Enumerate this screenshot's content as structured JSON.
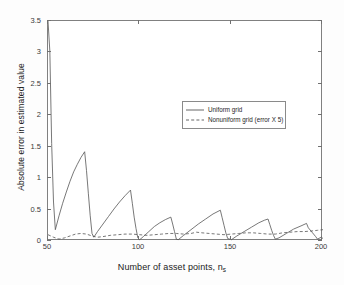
{
  "chart_data": {
    "type": "line",
    "title": "",
    "xlabel": "Number of asset points, n_s",
    "ylabel": "Absolute error in estimated value",
    "xlim": [
      50,
      200
    ],
    "ylim": [
      0,
      3.5
    ],
    "xticks": [
      50,
      100,
      150,
      200
    ],
    "yticks": [
      0,
      0.5,
      1,
      1.5,
      2,
      2.5,
      3,
      3.5
    ],
    "xtick_labels": [
      "50",
      "100",
      "150",
      "200"
    ],
    "ytick_labels": [
      "0",
      "0.5",
      "1",
      "1.5",
      "2",
      "2.5",
      "3",
      "3.5"
    ],
    "grid": false,
    "legend_position": "upper-center-right",
    "series": [
      {
        "name": "Uniform grid",
        "style": "solid",
        "color": "#555555",
        "points": [
          [
            50,
            3.5
          ],
          [
            51,
            3.02
          ],
          [
            52,
            1.55
          ],
          [
            53,
            0.62
          ],
          [
            54,
            0.18
          ],
          [
            56,
            0.4
          ],
          [
            58,
            0.6
          ],
          [
            60,
            0.78
          ],
          [
            62,
            0.95
          ],
          [
            64,
            1.1
          ],
          [
            66,
            1.22
          ],
          [
            68,
            1.33
          ],
          [
            70,
            1.42
          ],
          [
            71,
            1.12
          ],
          [
            72,
            0.76
          ],
          [
            73,
            0.41
          ],
          [
            74,
            0.12
          ],
          [
            75,
            0.06
          ],
          [
            77,
            0.15
          ],
          [
            80,
            0.27
          ],
          [
            83,
            0.39
          ],
          [
            86,
            0.51
          ],
          [
            89,
            0.62
          ],
          [
            92,
            0.72
          ],
          [
            95,
            0.81
          ],
          [
            96,
            0.6
          ],
          [
            97,
            0.38
          ],
          [
            98,
            0.2
          ],
          [
            99,
            0.05
          ],
          [
            100,
            0.02
          ],
          [
            102,
            0.07
          ],
          [
            105,
            0.15
          ],
          [
            108,
            0.23
          ],
          [
            111,
            0.29
          ],
          [
            114,
            0.34
          ],
          [
            117,
            0.38
          ],
          [
            118,
            0.27
          ],
          [
            119,
            0.15
          ],
          [
            120,
            0.03
          ],
          [
            121,
            0.02
          ],
          [
            124,
            0.09
          ],
          [
            128,
            0.18
          ],
          [
            132,
            0.27
          ],
          [
            136,
            0.35
          ],
          [
            140,
            0.43
          ],
          [
            144,
            0.49
          ],
          [
            145,
            0.37
          ],
          [
            146,
            0.25
          ],
          [
            147,
            0.13
          ],
          [
            148,
            0.04
          ],
          [
            150,
            0.02
          ],
          [
            153,
            0.08
          ],
          [
            157,
            0.15
          ],
          [
            161,
            0.22
          ],
          [
            165,
            0.29
          ],
          [
            168,
            0.33
          ],
          [
            170,
            0.35
          ],
          [
            171,
            0.26
          ],
          [
            172,
            0.17
          ],
          [
            173,
            0.09
          ],
          [
            174,
            0.03
          ],
          [
            176,
            0.05
          ],
          [
            180,
            0.12
          ],
          [
            184,
            0.19
          ],
          [
            188,
            0.24
          ],
          [
            191,
            0.28
          ],
          [
            192,
            0.21
          ],
          [
            194,
            0.14
          ],
          [
            196,
            0.07
          ],
          [
            197,
            0.03
          ],
          [
            199,
            0.06
          ],
          [
            200,
            0.04
          ]
        ]
      },
      {
        "name": "Nonuniform grid (error X 5)",
        "style": "dashed",
        "color": "#555555",
        "points": [
          [
            50,
            0.1
          ],
          [
            53,
            0.06
          ],
          [
            56,
            0.03
          ],
          [
            59,
            0.05
          ],
          [
            62,
            0.08
          ],
          [
            65,
            0.11
          ],
          [
            68,
            0.12
          ],
          [
            71,
            0.11
          ],
          [
            74,
            0.08
          ],
          [
            77,
            0.06
          ],
          [
            80,
            0.07
          ],
          [
            84,
            0.09
          ],
          [
            88,
            0.1
          ],
          [
            92,
            0.11
          ],
          [
            96,
            0.11
          ],
          [
            100,
            0.1
          ],
          [
            104,
            0.09
          ],
          [
            108,
            0.1
          ],
          [
            112,
            0.11
          ],
          [
            116,
            0.12
          ],
          [
            120,
            0.12
          ],
          [
            124,
            0.11
          ],
          [
            128,
            0.12
          ],
          [
            131,
            0.14
          ],
          [
            134,
            0.13
          ],
          [
            138,
            0.12
          ],
          [
            142,
            0.11
          ],
          [
            146,
            0.1
          ],
          [
            150,
            0.11
          ],
          [
            154,
            0.12
          ],
          [
            158,
            0.13
          ],
          [
            162,
            0.13
          ],
          [
            166,
            0.12
          ],
          [
            170,
            0.11
          ],
          [
            174,
            0.11
          ],
          [
            178,
            0.13
          ],
          [
            182,
            0.14
          ],
          [
            186,
            0.15
          ],
          [
            190,
            0.15
          ],
          [
            194,
            0.16
          ],
          [
            197,
            0.17
          ],
          [
            200,
            0.18
          ]
        ]
      }
    ]
  },
  "legend": {
    "items": [
      {
        "label": "Uniform grid"
      },
      {
        "label": "Nonuniform grid (error X 5)"
      }
    ]
  },
  "axes": {
    "x_title_main": "Number of asset points, n",
    "x_title_sub": "s",
    "y_title": "Absolute error in estimated value"
  },
  "colors": {
    "line": "#555555",
    "axis": "#808080",
    "background": "#ffffff",
    "text": "#222222"
  }
}
